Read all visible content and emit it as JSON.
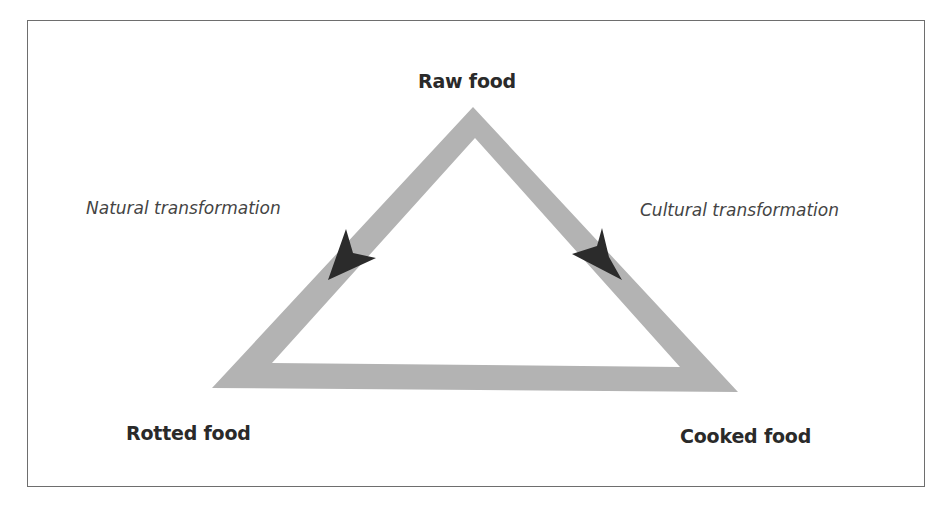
{
  "diagram": {
    "type": "culinary-triangle",
    "nodes": {
      "raw": "Raw food",
      "rotted": "Rotted food",
      "cooked": "Cooked food"
    },
    "edges": {
      "natural": "Natural transformation",
      "cultural": "Cultural transformation"
    },
    "colors": {
      "triangle_fill": "#b3b3b3",
      "arrow_fill": "#2b2b2b",
      "text": "#2a2a2a",
      "frame": "#6e6e6e"
    }
  }
}
